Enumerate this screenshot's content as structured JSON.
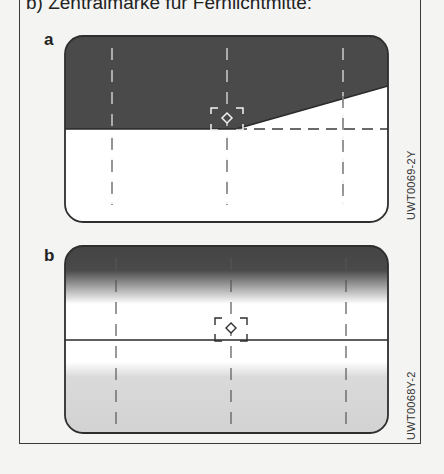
{
  "caption": "b) Zentralmarke für Fernlichtmitte:",
  "panels": [
    {
      "label": "a",
      "code": "UWT0069-2Y",
      "description": "Screen with sharp asymmetric light/dark cutoff; dashed horizon line; rising cutoff on right side; center mark with diamond"
    },
    {
      "label": "b",
      "code": "UWT0068Y-2",
      "description": "Screen with gradient dark-to-light at top and light gray at bottom; solid horizon line; center mark with diamond"
    }
  ],
  "colors": {
    "dark_fill": "#4a4a4a",
    "light_fill": "#ffffff",
    "bottom_gray": "#d4d4d4",
    "line": "#3a3a3a",
    "background": "#f4f4f2"
  }
}
